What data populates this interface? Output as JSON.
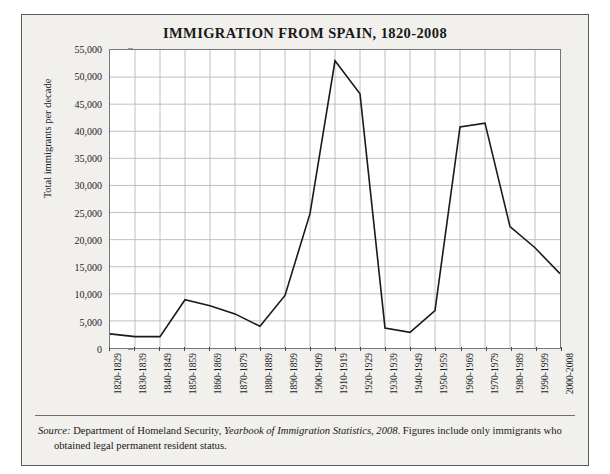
{
  "page": {
    "top_cut_text": ""
  },
  "figure": {
    "title": "IMMIGRATION FROM SPAIN, 1820-2008",
    "source_label": "Source:",
    "source_agency": " Department of Homeland Security, ",
    "source_publication": "Yearbook of Immigration Statistics, 2008",
    "source_rest": ". Figures include only immigrants who",
    "source_line2": "obtained legal permanent resident status."
  },
  "chart_data": {
    "type": "line",
    "title": "IMMIGRATION FROM SPAIN, 1820-2008",
    "xlabel": "",
    "ylabel": "Total immigrants per decade",
    "ylim": [
      0,
      55000
    ],
    "ytick_labels": [
      "55,000",
      "50,000",
      "45,000",
      "40,000",
      "35,000",
      "30,000",
      "25,000",
      "20,000",
      "15,000",
      "10,000",
      "5,000",
      "0"
    ],
    "ytick_values": [
      55000,
      50000,
      45000,
      40000,
      35000,
      30000,
      25000,
      20000,
      15000,
      10000,
      5000,
      0
    ],
    "grid": true,
    "legend": "none",
    "line_color": "#1a1a1a",
    "categories": [
      "1820-1829",
      "1830-1839",
      "1840-1849",
      "1850-1859",
      "1860-1869",
      "1870-1879",
      "1880-1889",
      "1890-1899",
      "1900-1909",
      "1910-1919",
      "1920-1929",
      "1930-1939",
      "1940-1949",
      "1950-1959",
      "1960-1969",
      "1970-1979",
      "1980-1989",
      "1990-1999",
      "2000-2008"
    ],
    "values": [
      2600,
      2100,
      2100,
      8900,
      7800,
      6300,
      4000,
      9700,
      24800,
      53000,
      46900,
      3700,
      2900,
      6900,
      40800,
      41500,
      22400,
      18500,
      13700
    ]
  }
}
